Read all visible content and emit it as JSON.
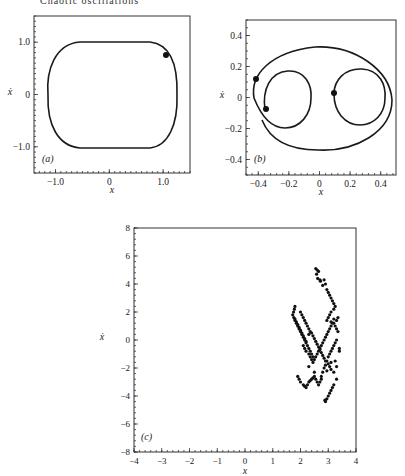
{
  "page": {
    "running_head": "Chaotic oscillations"
  },
  "chart_data": [
    {
      "id": "a",
      "type": "line",
      "panel_label": "(a)",
      "title": "",
      "xlabel": "x",
      "ylabel": "ẋ",
      "xlim": [
        -1.4,
        1.5
      ],
      "ylim": [
        -1.5,
        1.5
      ],
      "xticks": [
        -1.0,
        0,
        1.0
      ],
      "xtick_labels": [
        "−1.0",
        "0",
        "1.0"
      ],
      "yticks": [
        -1.0,
        0,
        1.0
      ],
      "ytick_labels": [
        "−1.0",
        "0",
        "1.0"
      ],
      "description": "Closed limit cycle, rounded-rectangle shape spanning x≈±1.25, ẋ≈±1.05",
      "series": [
        {
          "name": "limit cycle",
          "x": [
            -1.25,
            -1.2,
            -0.9,
            -0.5,
            0.0,
            0.5,
            0.9,
            1.2,
            1.25,
            1.2,
            0.9,
            0.5,
            0.0,
            -0.5,
            -0.9,
            -1.2,
            -1.25
          ],
          "y": [
            0.0,
            0.6,
            0.95,
            1.0,
            1.0,
            1.0,
            0.95,
            0.6,
            0.0,
            -0.6,
            -0.97,
            -1.03,
            -1.03,
            -1.02,
            -0.97,
            -0.6,
            0.0
          ]
        }
      ],
      "markers": [
        {
          "x": 1.08,
          "y": 0.77
        }
      ]
    },
    {
      "id": "b",
      "type": "line",
      "panel_label": "(b)",
      "title": "",
      "xlabel": "x",
      "ylabel": "ẋ",
      "xlim": [
        -0.48,
        0.5
      ],
      "ylim": [
        -0.5,
        0.5
      ],
      "xticks": [
        -0.4,
        -0.2,
        0,
        0.2,
        0.4
      ],
      "xtick_labels": [
        "−0.4",
        "−0.2",
        "0",
        "0.2",
        "0.4"
      ],
      "yticks": [
        -0.4,
        -0.2,
        0,
        0.2,
        0.4
      ],
      "ytick_labels": [
        "−0.4",
        "−0.2",
        "0",
        "0.2",
        "0.4"
      ],
      "description": "Period-3 orbit: one large loop enclosing two smaller loops centered near x≈-0.22 and x≈0.25",
      "markers": [
        {
          "x": -0.42,
          "y": 0.12
        },
        {
          "x": -0.36,
          "y": -0.08
        },
        {
          "x": 0.08,
          "y": 0.02
        }
      ]
    },
    {
      "id": "c",
      "type": "scatter",
      "panel_label": "(c)",
      "title": "",
      "xlabel": "x",
      "ylabel": "ẋ",
      "xlim": [
        -4,
        4
      ],
      "ylim": [
        -8,
        8
      ],
      "xticks": [
        -4,
        -3,
        -2,
        -1,
        0,
        1,
        2,
        3,
        4
      ],
      "xtick_labels": [
        "−4",
        "−3",
        "−2",
        "−1",
        "0",
        "1",
        "2",
        "3",
        "4"
      ],
      "yticks": [
        -8,
        -6,
        -4,
        -2,
        0,
        2,
        4,
        6,
        8
      ],
      "ytick_labels": [
        "−8",
        "−6",
        "−4",
        "−2",
        "0",
        "2",
        "4",
        "6",
        "8"
      ],
      "description": "Poincaré section of chaotic attractor: points clustered between x≈1.7 and 3.4, ẋ≈-4.4 to 5.2",
      "series": [
        {
          "name": "Poincaré points",
          "x": [
            2.55,
            2.6,
            2.65,
            2.58,
            2.62,
            2.7,
            2.72,
            2.85,
            2.9,
            2.8,
            2.95,
            3.0,
            3.05,
            3.1,
            3.15,
            3.2,
            3.25,
            3.2,
            3.1,
            3.05,
            3.0,
            2.95,
            3.15,
            3.25,
            3.3,
            3.35,
            3.2,
            3.1,
            1.8,
            1.78,
            1.75,
            1.72,
            1.76,
            1.8,
            1.85,
            1.9,
            1.95,
            2.0,
            2.05,
            2.1,
            2.15,
            2.2,
            2.25,
            2.3,
            2.35,
            2.4,
            2.45,
            2.0,
            2.05,
            2.1,
            2.15,
            2.2,
            2.25,
            2.3,
            1.9,
            1.95,
            2.0,
            2.1,
            2.15,
            2.2,
            2.25,
            2.3,
            2.35,
            2.4,
            2.45,
            2.5,
            2.55,
            2.6,
            2.65,
            2.7,
            2.75,
            2.8,
            2.85,
            2.9,
            2.95,
            3.0,
            3.05,
            3.1,
            3.15,
            3.2,
            3.25,
            3.3,
            3.4,
            2.1,
            2.15,
            2.2,
            2.3,
            2.35,
            2.4,
            2.45,
            2.5,
            2.55,
            2.6,
            2.65,
            2.7,
            2.75,
            2.8,
            2.85,
            2.9,
            2.95,
            3.0,
            3.05,
            3.1,
            3.2,
            3.3,
            3.35,
            3.4,
            1.8,
            1.85,
            1.9,
            1.95,
            2.0,
            2.05,
            2.1,
            2.15,
            2.2,
            2.3,
            2.35,
            2.4,
            2.45,
            2.5,
            2.55,
            2.6,
            2.65,
            2.7,
            2.75,
            2.8,
            2.85,
            2.9,
            3.0,
            3.05,
            3.1,
            3.2,
            2.9,
            2.95,
            3.0,
            3.05,
            3.1,
            3.15,
            2.88,
            3.2,
            3.3,
            3.25,
            2.3,
            2.5,
            2.75,
            2.95,
            3.1,
            3.3
          ],
          "y": [
            5.1,
            5.0,
            4.9,
            4.7,
            4.4,
            4.3,
            4.2,
            4.3,
            4.0,
            3.9,
            3.6,
            3.4,
            3.2,
            3.0,
            2.8,
            2.6,
            2.4,
            2.2,
            2.0,
            1.8,
            1.6,
            1.4,
            1.2,
            1.0,
            0.8,
            0.6,
            1.5,
            1.3,
            2.4,
            2.2,
            2.0,
            1.8,
            1.6,
            1.4,
            1.2,
            1.0,
            0.8,
            0.6,
            0.4,
            0.2,
            0.0,
            -0.2,
            -0.4,
            -0.6,
            -0.8,
            -1.0,
            -1.2,
            2.0,
            1.8,
            1.6,
            1.4,
            1.2,
            1.0,
            0.8,
            -2.6,
            -2.8,
            -3.0,
            -3.2,
            -3.3,
            -3.4,
            -3.2,
            -3.0,
            -2.9,
            -2.8,
            -2.7,
            -2.6,
            -2.8,
            -3.0,
            -3.2,
            -3.0,
            -2.6,
            -2.3,
            -2.0,
            -1.8,
            -1.5,
            -1.2,
            -1.0,
            -0.8,
            -0.6,
            -0.4,
            -0.2,
            0.0,
            -0.6,
            -0.4,
            -0.6,
            -0.8,
            -1.0,
            -1.2,
            -1.4,
            -1.6,
            -1.4,
            -1.2,
            -1.0,
            -0.8,
            -0.6,
            -0.4,
            -0.2,
            0.0,
            0.2,
            0.4,
            0.6,
            0.8,
            1.0,
            1.2,
            1.4,
            1.6,
            -0.8,
            1.5,
            1.3,
            1.1,
            0.9,
            0.7,
            0.5,
            0.3,
            0.1,
            -0.1,
            0.4,
            0.6,
            0.5,
            0.3,
            0.1,
            -0.1,
            -0.3,
            -0.5,
            -0.7,
            -0.9,
            -1.1,
            -1.3,
            -1.5,
            -1.7,
            -1.9,
            -2.1,
            -2.3,
            -4.4,
            -4.2,
            -4.0,
            -3.8,
            -3.6,
            -3.4,
            -4.3,
            -3.2,
            -1.9,
            -1.5,
            -1.9,
            -2.3,
            -2.8,
            -2.2,
            -1.6,
            -2.8
          ]
        }
      ]
    }
  ]
}
